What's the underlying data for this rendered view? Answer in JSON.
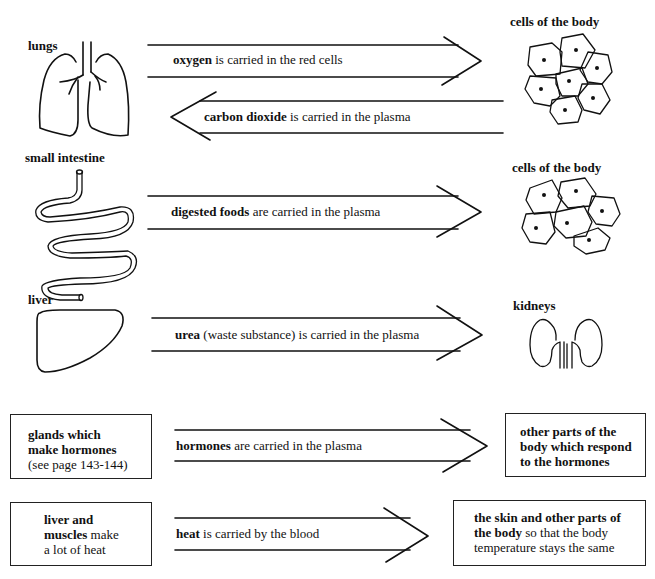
{
  "rows": [
    {
      "source": {
        "label": "lungs",
        "icon": "lungs-icon"
      },
      "target": {
        "label": "cells of the body",
        "icon": "cells-icon"
      },
      "arrow_forward": {
        "bold": "oxygen",
        "rest": " is carried in the red cells",
        "direction": "right"
      },
      "arrow_back": {
        "bold": "carbon dioxide",
        "rest": " is carried in the plasma",
        "direction": "left"
      }
    },
    {
      "source": {
        "label": "small intestine",
        "icon": "intestine-icon"
      },
      "target": {
        "label": "cells of the body",
        "icon": "cells-icon"
      },
      "arrow_forward": {
        "bold": "digested foods",
        "rest": " are carried in the plasma",
        "direction": "right"
      }
    },
    {
      "source": {
        "label": "liver",
        "icon": "liver-icon"
      },
      "target": {
        "label": "kidneys",
        "icon": "kidneys-icon"
      },
      "arrow_forward": {
        "bold": "urea",
        "rest": " (waste substance) is carried in the plasma",
        "direction": "right"
      }
    },
    {
      "source_box": {
        "line1": "glands which",
        "line2": "make hormones",
        "line3": "(see page 143-144)"
      },
      "target_box": {
        "line1": "other parts of the",
        "line2": "body which respond",
        "line3": "to the hormones"
      },
      "arrow_forward": {
        "bold": "hormones",
        "rest": " are carried in the plasma",
        "direction": "right"
      }
    },
    {
      "source_box": {
        "line1_bold": "liver and",
        "line2_bold": "muscles",
        "line2_rest": " make",
        "line3": "a lot of heat"
      },
      "target_box": {
        "line1_bold": "the skin and other parts of",
        "line2_bold": "the body",
        "line2_rest": " so that the body",
        "line3": "temperature stays the same"
      },
      "arrow_forward": {
        "bold": "heat",
        "rest": " is carried by the blood",
        "direction": "right"
      }
    }
  ],
  "colors": {
    "ink": "#111111",
    "background": "#ffffff"
  }
}
